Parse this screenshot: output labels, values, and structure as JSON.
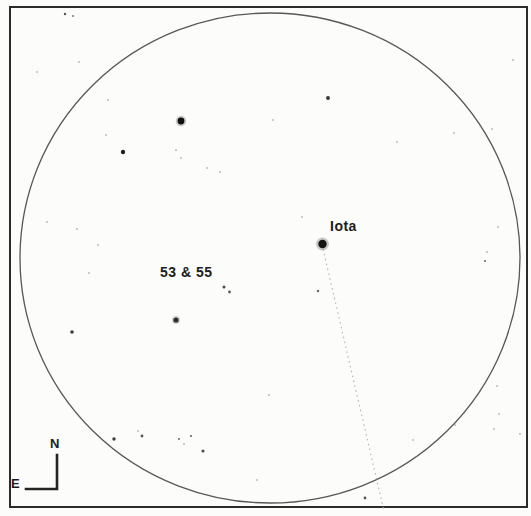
{
  "canvas": {
    "width": 531,
    "height": 516,
    "background": "#fcfcfa"
  },
  "chart": {
    "frame": {
      "x": 10,
      "y": 7,
      "w": 517,
      "h": 500,
      "stroke": "#2b2b2b",
      "stroke_width": 2
    },
    "field_circle": {
      "cx": 270,
      "cy": 258,
      "rx": 250,
      "ry": 245,
      "stroke": "#575757",
      "stroke_width": 1.3
    },
    "trail_line": {
      "x1": 323,
      "y1": 249,
      "x2": 384,
      "y2": 511,
      "color": "#b3b3b3",
      "dash": "1.6 3.4",
      "width": 1.1
    },
    "stars": [
      {
        "x": 322.5,
        "y": 244,
        "r": 4.2,
        "c": "#141414",
        "halo": true
      },
      {
        "x": 181,
        "y": 121,
        "r": 3.4,
        "c": "#101010",
        "halo": true
      },
      {
        "x": 176,
        "y": 320,
        "r": 2.6,
        "c": "#2e2e2e",
        "halo": true
      },
      {
        "x": 123,
        "y": 152,
        "r": 2.2,
        "c": "#222222",
        "halo": false
      },
      {
        "x": 328,
        "y": 98,
        "r": 1.9,
        "c": "#333333",
        "halo": false
      },
      {
        "x": 72,
        "y": 332,
        "r": 1.8,
        "c": "#3c3c3c",
        "halo": false
      },
      {
        "x": 224,
        "y": 287,
        "r": 1.5,
        "c": "#4a4a4a",
        "halo": false
      },
      {
        "x": 229.5,
        "y": 292,
        "r": 1.4,
        "c": "#5a5a5a",
        "halo": false
      },
      {
        "x": 114,
        "y": 439,
        "r": 1.7,
        "c": "#3c3c3c",
        "halo": false
      },
      {
        "x": 142,
        "y": 436,
        "r": 1.4,
        "c": "#555555",
        "halo": false
      },
      {
        "x": 203,
        "y": 451,
        "r": 1.6,
        "c": "#4f4f4f",
        "halo": false
      },
      {
        "x": 365,
        "y": 498,
        "r": 1.4,
        "c": "#555555",
        "halo": false
      },
      {
        "x": 318,
        "y": 291,
        "r": 1.2,
        "c": "#666666",
        "halo": false
      },
      {
        "x": 191,
        "y": 436,
        "r": 1.1,
        "c": "#6a6a6a",
        "halo": false
      },
      {
        "x": 179,
        "y": 439,
        "r": 1.0,
        "c": "#6a6a6a",
        "halo": false
      },
      {
        "x": 485,
        "y": 261,
        "r": 1.1,
        "c": "#6a6a6a",
        "halo": false
      },
      {
        "x": 65,
        "y": 14,
        "r": 1.2,
        "c": "#555555",
        "halo": false
      },
      {
        "x": 73,
        "y": 16,
        "r": 1.0,
        "c": "#777777",
        "halo": false
      }
    ],
    "speckles": [
      [
        37,
        72
      ],
      [
        79,
        62
      ],
      [
        108,
        100
      ],
      [
        106,
        135
      ],
      [
        176,
        150
      ],
      [
        181,
        158
      ],
      [
        207,
        168
      ],
      [
        220,
        172
      ],
      [
        273,
        120
      ],
      [
        302,
        217
      ],
      [
        454,
        133
      ],
      [
        492,
        129
      ],
      [
        397,
        142
      ],
      [
        47,
        222
      ],
      [
        77,
        229
      ],
      [
        98,
        245
      ],
      [
        89,
        273
      ],
      [
        269,
        395
      ],
      [
        257,
        480
      ],
      [
        497,
        386
      ],
      [
        499,
        414
      ],
      [
        494,
        429
      ],
      [
        455,
        425
      ],
      [
        413,
        440
      ],
      [
        520,
        434
      ],
      [
        498,
        227
      ],
      [
        487,
        252
      ],
      [
        138,
        431
      ],
      [
        184,
        444
      ],
      [
        513,
        60
      ]
    ],
    "speckle_style": {
      "r": 0.9,
      "c": "#9b9b9b"
    }
  },
  "labels": {
    "iota": {
      "text": "Iota",
      "x": 330,
      "y": 219
    },
    "pair": {
      "text": "53 & 55",
      "x": 160,
      "y": 265
    }
  },
  "compass": {
    "north": {
      "text": "N",
      "x": 50,
      "y": 437
    },
    "east": {
      "text": "E",
      "x": 11,
      "y": 477
    },
    "corner_x": 57,
    "corner_y": 489,
    "arm_up": 34,
    "arm_left": 31,
    "stroke": "#242424",
    "stroke_width": 2.6,
    "dash": "2.4 1.2"
  }
}
